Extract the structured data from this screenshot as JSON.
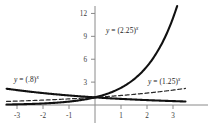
{
  "figure": {
    "background": "#ffffff",
    "axis_color": "#7a7a7a",
    "curve_color": "#111111"
  },
  "chart_data": {
    "type": "line",
    "title": "",
    "xlabel": "",
    "ylabel": "",
    "xlim": [
      -3.4,
      3.5
    ],
    "ylim": [
      -0.9,
      13.2
    ],
    "grid": false,
    "legend": "inline-annotations",
    "xticks": [
      -3,
      -2,
      -1,
      1,
      2,
      3
    ],
    "xtick_labels": [
      "-3",
      "-2",
      "-1",
      "1",
      "2",
      "3"
    ],
    "yticks": [
      3,
      6,
      9,
      12
    ],
    "ytick_labels": [
      "3",
      "6",
      "9",
      "12"
    ],
    "series": [
      {
        "name": "y = (2.25)^x",
        "base": 2.25,
        "style": "solid",
        "linewidth": 2.1,
        "color": "#111111",
        "x": [
          -3,
          -2.5,
          -2,
          -1.5,
          -1,
          -0.5,
          0,
          0.5,
          1,
          1.5,
          2,
          2.5,
          3,
          3.15
        ],
        "y": [
          0.0878,
          0.1317,
          0.1975,
          0.2963,
          0.4444,
          0.6667,
          1,
          1.5,
          2.25,
          3.375,
          5.0625,
          7.594,
          11.39,
          12.85
        ]
      },
      {
        "name": "y = (1.25)^x",
        "base": 1.25,
        "style": "dashed",
        "linewidth": 1.2,
        "color": "#2a2a2a",
        "x": [
          -3,
          -2.5,
          -2,
          -1.5,
          -1,
          -0.5,
          0,
          0.5,
          1,
          1.5,
          2,
          2.5,
          3,
          3.4
        ],
        "y": [
          0.512,
          0.5724,
          0.64,
          0.7155,
          0.8,
          0.8944,
          1,
          1.118,
          1.25,
          1.3975,
          1.5625,
          1.7469,
          1.9531,
          2.1147
        ]
      },
      {
        "name": "y = (.8)^x",
        "base": 0.8,
        "style": "solid",
        "linewidth": 2.1,
        "color": "#111111",
        "x": [
          -3,
          -2.5,
          -2,
          -1.5,
          -1,
          -0.5,
          0,
          0.5,
          1,
          1.5,
          2,
          2.5,
          3,
          3.4
        ],
        "y": [
          1.9531,
          1.7469,
          1.5625,
          1.3975,
          1.25,
          1.118,
          1,
          0.8944,
          0.8,
          0.7155,
          0.64,
          0.5724,
          0.512,
          0.4624
        ]
      }
    ],
    "annotations": [
      {
        "name": "label-225",
        "text": "y = (2.25)^x",
        "x": 0.45,
        "y": 9.6
      },
      {
        "name": "label-08",
        "text": "y = (.8)^x",
        "x": -2.95,
        "y": 3.9
      },
      {
        "name": "label-125",
        "text": "y = (1.25)^x",
        "x": 2.05,
        "y": 3.6
      }
    ]
  },
  "labels": {
    "curve_225": {
      "lhs": "y",
      "eq": " = (2.25)",
      "exp": "x"
    },
    "curve_08": {
      "lhs": "y",
      "eq": " = (.8)",
      "exp": "x"
    },
    "curve_125": {
      "lhs": "y",
      "eq": " = (1.25)",
      "exp": "x"
    }
  }
}
